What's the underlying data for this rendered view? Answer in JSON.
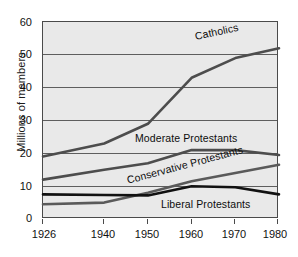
{
  "chart_data": {
    "type": "line",
    "title": "",
    "xlabel": "",
    "ylabel": "Millions of members",
    "x": [
      1926,
      1940,
      1950,
      1960,
      1970,
      1980
    ],
    "xtick_labels": [
      "1926",
      "1940",
      "1950",
      "1960",
      "1970",
      "1980"
    ],
    "ytick_labels": [
      "0",
      "10",
      "20",
      "30",
      "40",
      "50",
      "60"
    ],
    "yticks": [
      0,
      10,
      20,
      30,
      40,
      50,
      60
    ],
    "xlim": [
      1926,
      1980
    ],
    "ylim": [
      0,
      60
    ],
    "grid": true,
    "legend_position": "inline-labels",
    "series": [
      {
        "name": "Catholics",
        "color": "#4d4d4d",
        "label_rotation": -12,
        "values": [
          19,
          23,
          29,
          43,
          49,
          52
        ]
      },
      {
        "name": "Moderate Protestants",
        "color": "#4d4d4d",
        "label_rotation": 0,
        "values": [
          12,
          15,
          17,
          21,
          21,
          19.5
        ]
      },
      {
        "name": "Conservative Protestants",
        "color": "#5a5a5a",
        "label_rotation": -15,
        "values": [
          4.5,
          5,
          8,
          11.5,
          14,
          16.5
        ]
      },
      {
        "name": "Liberal Protestants",
        "color": "#111111",
        "label_rotation": 0,
        "values": [
          7.5,
          7.3,
          7.2,
          10,
          9.7,
          7.5
        ]
      }
    ],
    "annotations": [
      {
        "text": "Catholics",
        "x": 1971,
        "y": 53
      },
      {
        "text": "Moderate Protestants",
        "x": 1955,
        "y": 23
      },
      {
        "text": "Conservative Protestants",
        "x": 1953,
        "y": 14
      },
      {
        "text": "Liberal Protestants",
        "x": 1962,
        "y": 6
      }
    ]
  },
  "axis": {
    "y_title": "Millions of members",
    "y_labels": [
      "60",
      "50",
      "40",
      "30",
      "20",
      "10",
      "0"
    ],
    "x_labels": [
      "1926",
      "1940",
      "1950",
      "1960",
      "1970",
      "1980"
    ]
  },
  "series_labels": {
    "catholics": "Catholics",
    "moderate": "Moderate Protestants",
    "conservative": "Conservative Protestants",
    "liberal": "Liberal Protestants"
  }
}
